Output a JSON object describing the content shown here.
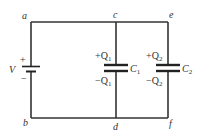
{
  "diagram": {
    "type": "circuit",
    "colors": {
      "wire": "#333333",
      "plate": "#222222",
      "text": "#333333",
      "background": "#ffffff"
    },
    "nodes": {
      "a": "a",
      "b": "b",
      "c": "c",
      "d": "d",
      "e": "e",
      "f": "f"
    },
    "battery": {
      "label": "V",
      "plus": "+",
      "minus": "−"
    },
    "capacitors": [
      {
        "name": "C",
        "sub": "1",
        "top_charge": "+Q",
        "top_sub": "1",
        "bottom_charge": "−Q",
        "bottom_sub": "1"
      },
      {
        "name": "C",
        "sub": "2",
        "top_charge": "+Q",
        "top_sub": "2",
        "bottom_charge": "−Q",
        "bottom_sub": "2"
      }
    ],
    "connections": [
      [
        "a",
        "c"
      ],
      [
        "c",
        "e"
      ],
      [
        "b",
        "d"
      ],
      [
        "d",
        "f"
      ],
      [
        "a",
        "battery+"
      ],
      [
        "battery-",
        "b"
      ],
      [
        "c",
        "C1+"
      ],
      [
        "C1-",
        "d"
      ],
      [
        "e",
        "C2+"
      ],
      [
        "C2-",
        "f"
      ]
    ]
  }
}
